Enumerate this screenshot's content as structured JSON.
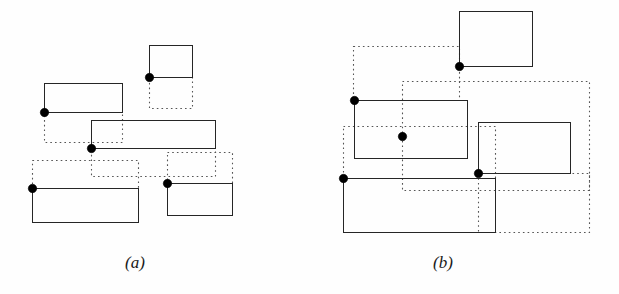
{
  "figure": {
    "title": "",
    "background_color": "#fefefe",
    "stroke_color": "#262626",
    "dotted_color": "#555555",
    "dot_color": "#000000",
    "solid_stroke_width": 1.4,
    "dotted_stroke_width": 1.1,
    "dot_radius": 4.2
  },
  "captions": {
    "a": "(a)",
    "b": "(b)"
  },
  "chart_data": {
    "type": "diagram",
    "title": "",
    "xlabel": "",
    "ylabel": "",
    "panels": [
      {
        "id": "a",
        "label": "(a)",
        "label_position": {
          "x": 135,
          "y": 266
        },
        "solid_rects": [
          {
            "name": "a-solid-top-right",
            "x": 149,
            "y": 45,
            "w": 43,
            "h": 32
          },
          {
            "name": "a-solid-upper-left",
            "x": 44,
            "y": 83,
            "w": 78,
            "h": 29
          },
          {
            "name": "a-solid-middle-wide",
            "x": 91,
            "y": 120,
            "w": 124,
            "h": 28
          },
          {
            "name": "a-solid-bottom-left",
            "x": 32,
            "y": 188,
            "w": 106,
            "h": 34
          },
          {
            "name": "a-solid-bottom-right",
            "x": 167,
            "y": 183,
            "w": 65,
            "h": 32
          }
        ],
        "dotted_rects": [
          {
            "name": "a-dotted-top-right",
            "x": 149,
            "y": 77,
            "w": 43,
            "h": 31
          },
          {
            "name": "a-dotted-upper-left",
            "x": 44,
            "y": 112,
            "w": 78,
            "h": 30
          },
          {
            "name": "a-dotted-middle-wide",
            "x": 91,
            "y": 148,
            "w": 124,
            "h": 28
          },
          {
            "name": "a-dotted-bottom-left",
            "x": 32,
            "y": 160,
            "w": 106,
            "h": 28
          },
          {
            "name": "a-dotted-bottom-right",
            "x": 167,
            "y": 152,
            "w": 65,
            "h": 31
          }
        ],
        "points": [
          {
            "name": "a-point-1",
            "x": 149,
            "y": 77
          },
          {
            "name": "a-point-2",
            "x": 44,
            "y": 112
          },
          {
            "name": "a-point-3",
            "x": 91,
            "y": 148
          },
          {
            "name": "a-point-4",
            "x": 32,
            "y": 188
          },
          {
            "name": "a-point-5",
            "x": 167,
            "y": 183
          }
        ]
      },
      {
        "id": "b",
        "label": "(b)",
        "label_position": {
          "x": 443,
          "y": 266
        },
        "solid_rects": [
          {
            "name": "b-solid-top",
            "x": 459,
            "y": 11,
            "w": 73,
            "h": 55
          },
          {
            "name": "b-solid-middle-left",
            "x": 354,
            "y": 100,
            "w": 113,
            "h": 58
          },
          {
            "name": "b-solid-right",
            "x": 478,
            "y": 122,
            "w": 92,
            "h": 51
          },
          {
            "name": "b-solid-bottom",
            "x": 343,
            "y": 178,
            "w": 152,
            "h": 54
          }
        ],
        "dotted_rects": [
          {
            "name": "b-dotted-top",
            "x": 353,
            "y": 46,
            "w": 106,
            "h": 54
          },
          {
            "name": "b-dotted-middle",
            "x": 402,
            "y": 81,
            "w": 187,
            "h": 109
          },
          {
            "name": "b-dotted-lower-left",
            "x": 343,
            "y": 126,
            "w": 152,
            "h": 52
          },
          {
            "name": "b-dotted-bottom-right",
            "x": 478,
            "y": 173,
            "w": 111,
            "h": 59
          }
        ],
        "points": [
          {
            "name": "b-point-1",
            "x": 459,
            "y": 66
          },
          {
            "name": "b-point-2",
            "x": 354,
            "y": 100
          },
          {
            "name": "b-point-3",
            "x": 402,
            "y": 136
          },
          {
            "name": "b-point-4",
            "x": 478,
            "y": 173
          },
          {
            "name": "b-point-5",
            "x": 343,
            "y": 178
          }
        ]
      }
    ]
  }
}
